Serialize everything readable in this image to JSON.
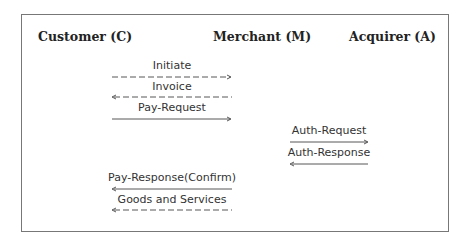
{
  "participants": [
    {
      "id": "C",
      "label": "Customer (C)"
    },
    {
      "id": "M",
      "label": "Merchant (M)"
    },
    {
      "id": "A",
      "label": "Acquirer (A)"
    }
  ],
  "messages": [
    {
      "label": "Initiate",
      "from": "C",
      "to": "M",
      "style": "dashed"
    },
    {
      "label": "Invoice",
      "from": "M",
      "to": "C",
      "style": "dashed"
    },
    {
      "label": "Pay-Request",
      "from": "C",
      "to": "M",
      "style": "solid"
    },
    {
      "label": "Auth-Request",
      "from": "M",
      "to": "A",
      "style": "solid"
    },
    {
      "label": "Auth-Response",
      "from": "A",
      "to": "M",
      "style": "solid"
    },
    {
      "label": "Pay-Response(Confirm)",
      "from": "M",
      "to": "C",
      "style": "solid"
    },
    {
      "label": "Goods and Services",
      "from": "M",
      "to": "C",
      "style": "dashed"
    }
  ]
}
